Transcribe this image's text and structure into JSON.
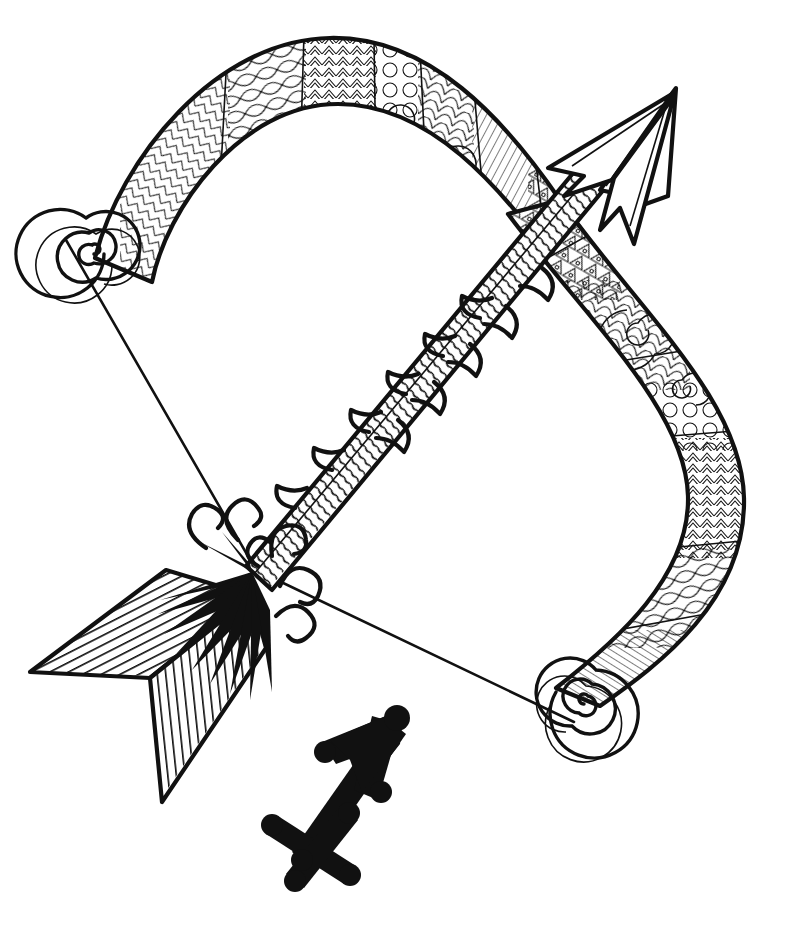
{
  "artwork": {
    "title": "Sagittarius Bow and Arrow",
    "subject": "zodiac-sagittarius",
    "style": "zentangle line art",
    "medium": "black ink on white",
    "canvas": {
      "width": 791,
      "height": 928
    },
    "colors": {
      "background": "#ffffff",
      "ink": "#111111"
    }
  },
  "elements": {
    "bow": {
      "name": "recurve-bow",
      "description": "S-curved ornamental bow spanning upper-left to lower-right",
      "upper_tip_spiral": {
        "cx": 62,
        "cy": 232,
        "turns": 5,
        "radius": 44
      },
      "lower_tip_spiral": {
        "cx": 578,
        "cy": 726,
        "turns": 5,
        "radius": 44
      },
      "patterns": [
        "herringbone-chevron",
        "koru-spiral",
        "circle-beads",
        "leaf-lattice",
        "parallel-hatching",
        "triangle-band"
      ]
    },
    "bowstring": {
      "name": "bowstring",
      "upper_anchor": {
        "x": 64,
        "y": 238
      },
      "nock": {
        "x": 258,
        "y": 570
      },
      "lower_anchor": {
        "x": 572,
        "y": 722
      }
    },
    "arrow": {
      "name": "arrow",
      "angle_degrees": -42,
      "tip": {
        "x": 676,
        "y": 88
      },
      "nock": {
        "x": 250,
        "y": 572
      },
      "head": "barbed-layered-arrowhead",
      "shaft_patterns": [
        "curved-hatching",
        "feather-barbs"
      ],
      "fletching": {
        "vanes": 2,
        "upper_vane_pattern": "horizontal-stripes",
        "lower_vane_pattern": "vertical-stripes"
      },
      "nock_burst": "solid-black-curled-tendrils"
    },
    "glyph": {
      "name": "sagittarius-zodiac-glyph",
      "symbol": "♐",
      "position": {
        "x": 275,
        "y": 700,
        "width": 145,
        "height": 175
      },
      "fill": "#111111"
    }
  }
}
